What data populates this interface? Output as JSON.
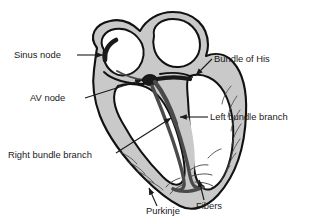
{
  "figure": {
    "background_color": "#ffffff",
    "width": 324,
    "height": 221
  },
  "colors": {
    "outline": "#111111",
    "myocardium_fill": "#c9c9c9",
    "chamber_fill": "#ffffff",
    "conduction_path": "#4a4a4a",
    "node_fill": "#1a1a1a",
    "leader_line": "#1a1a1a",
    "label_text": "#1a1a1a"
  },
  "labels": [
    {
      "id": "sinus-node",
      "text": "Sinus node",
      "x": 14,
      "y": 58,
      "anchor": "start"
    },
    {
      "id": "av-node",
      "text": "AV node",
      "x": 30,
      "y": 101,
      "anchor": "start"
    },
    {
      "id": "right-bundle-branch",
      "text": "Right bundle branch",
      "x": 8,
      "y": 158,
      "anchor": "start"
    },
    {
      "id": "bundle-of-his",
      "text": "Bundle of His",
      "x": 214,
      "y": 62,
      "anchor": "start"
    },
    {
      "id": "left-bundle-branch",
      "text": "Left bundle branch",
      "x": 210,
      "y": 120,
      "anchor": "start"
    },
    {
      "id": "purkinje",
      "text": "Purkinje",
      "x": 146,
      "y": 214,
      "anchor": "start"
    },
    {
      "id": "fibers",
      "text": "Fibers",
      "x": 196,
      "y": 209,
      "anchor": "start"
    }
  ],
  "anatomy_parts": [
    {
      "id": "right-atrium",
      "name": "Right atrium"
    },
    {
      "id": "left-atrium",
      "name": "Left atrium"
    },
    {
      "id": "right-ventricle",
      "name": "Right ventricle"
    },
    {
      "id": "left-ventricle",
      "name": "Left ventricle"
    },
    {
      "id": "interventricular-septum",
      "name": "Interventricular septum"
    },
    {
      "id": "myocardium-wall",
      "name": "Myocardial wall with muscle striations"
    }
  ],
  "conduction_pathway": [
    "Sinus node",
    "AV node",
    "Bundle of His",
    "Right bundle branch",
    "Left bundle branch",
    "Purkinje Fibers"
  ]
}
